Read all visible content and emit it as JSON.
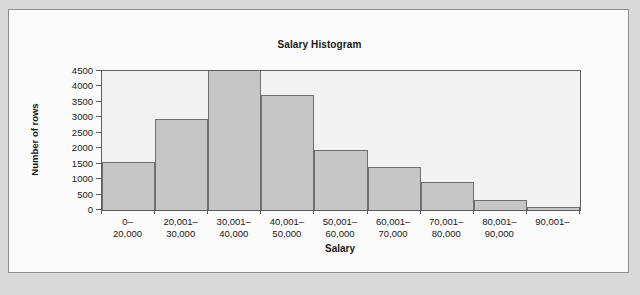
{
  "figure": {
    "background_color": "#d9d9d9",
    "panel_color": "#fbfbfb",
    "border_color": "#8d8d8d"
  },
  "chart_data": {
    "type": "bar",
    "title": "Salary Histogram",
    "xlabel": "Salary",
    "ylabel": "Number of rows",
    "categories": [
      "0–\n20,000",
      "20,001–\n30,000",
      "30,001–\n40,000",
      "40,001–\n50,000",
      "50,001–\n60,000",
      "60,001–\n70,000",
      "70,001–\n80,000",
      "80,001–\n90,000",
      "90,001–"
    ],
    "values": [
      1550,
      2950,
      4500,
      3720,
      1950,
      1400,
      900,
      320,
      100
    ],
    "value_notes": "Bar 3 (30,001-40,000) is clipped at the top of the axis at 4500",
    "ylim": [
      0,
      4500
    ],
    "ytick_values": [
      0,
      500,
      1000,
      1500,
      2000,
      2500,
      3000,
      3500,
      4000,
      4500
    ],
    "ytick_labels": [
      "0",
      "500",
      "1000",
      "1500",
      "2000",
      "2500",
      "3000",
      "3500",
      "4000",
      "4500"
    ],
    "grid": false,
    "legend": null,
    "bar_fill_color": "#c6c6c6",
    "bar_edge_color": "#6f6f73",
    "plot_background_color": "#f2f2f2",
    "axis_color": "#5d5d61"
  }
}
